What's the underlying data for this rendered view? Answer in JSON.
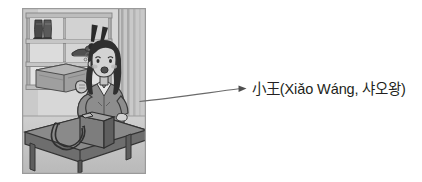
{
  "page": {
    "background_color": "#ffffff",
    "width": 422,
    "height": 182
  },
  "illustration": {
    "alt_label": "shoe-store-scene",
    "description": "Grayscale cartoon of a worried woman standing behind a shop counter in a shoe store, with two exclamation marks above her and a handbag on the counter.",
    "style": "grayscale",
    "border_color": "#9a9a9a",
    "elements": [
      {
        "name": "shelf-unit",
        "label": "shoe display shelving"
      },
      {
        "name": "boots",
        "label": "pair of boots on top shelf"
      },
      {
        "name": "shoes",
        "label": "pair of shoes on middle shelf"
      },
      {
        "name": "shoe-box",
        "label": "shoe box on lower shelf"
      },
      {
        "name": "woman-character",
        "label": "worried woman shop assistant"
      },
      {
        "name": "exclamation-marks",
        "label": "two exclamation marks"
      },
      {
        "name": "counter",
        "label": "counter table"
      },
      {
        "name": "handbag",
        "label": "handbag on counter"
      },
      {
        "name": "wall-panel",
        "label": "striped wall panel"
      }
    ]
  },
  "annotation": {
    "arrow_name": "pointer-arrow",
    "arrow_color": "#5f5f5f",
    "label": "小王(Xiǎo Wáng, 샤오왕)",
    "label_color": "#231f20",
    "label_parts": {
      "hanzi": "小王",
      "pinyin": "Xiǎo Wáng",
      "hangul": "샤오왕"
    }
  }
}
